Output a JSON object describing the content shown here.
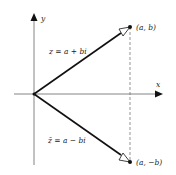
{
  "diagram": {
    "axes": {
      "x_label": "x",
      "y_label": "y"
    },
    "vectors": [
      {
        "label": "z = a + bi",
        "endpoint_label": "(a, b)"
      },
      {
        "label": "z̄ = a − bi",
        "endpoint_label": "(a, −b)"
      }
    ],
    "colors": {
      "line": "#222222",
      "axis": "#555555",
      "background": "#ffffff"
    }
  }
}
